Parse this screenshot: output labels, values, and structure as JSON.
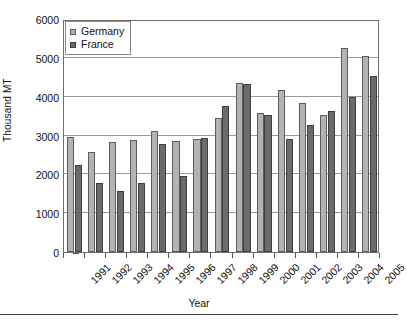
{
  "chart_data": {
    "type": "bar",
    "title": "",
    "xlabel": "Year",
    "ylabel": "Thousand MT",
    "ylim": [
      0,
      6000
    ],
    "ytick_step": 1000,
    "yticks": [
      0,
      1000,
      2000,
      3000,
      4000,
      5000,
      6000
    ],
    "ytick_labels": [
      "0",
      "1000",
      "2000",
      "3000",
      "4000",
      "5000",
      "6000"
    ],
    "grid": true,
    "legend_position": "top-left",
    "categories": [
      "1991",
      "1992",
      "1993",
      "1994",
      "1995",
      "1996",
      "1997",
      "1998",
      "1999",
      "2000",
      "2001",
      "2002",
      "2003",
      "2004",
      "2005"
    ],
    "series": [
      {
        "name": "Germany",
        "color": "#b3b3b3",
        "values": [
          2960,
          2580,
          2830,
          2880,
          3120,
          2870,
          2900,
          3450,
          4360,
          3590,
          4180,
          3850,
          3530,
          5250,
          5040
        ]
      },
      {
        "name": "France",
        "color": "#6b6b6b",
        "values": [
          2250,
          1790,
          1570,
          1770,
          2790,
          1960,
          2930,
          3750,
          4330,
          3520,
          2900,
          3280,
          3630,
          3990,
          4530
        ]
      }
    ]
  },
  "legend": {
    "entries": [
      {
        "label": "Germany",
        "swatch": "germany-swatch"
      },
      {
        "label": "France",
        "swatch": "france-swatch"
      }
    ]
  },
  "axes": {
    "y_title": "Thousand MT",
    "x_title": "Year"
  }
}
